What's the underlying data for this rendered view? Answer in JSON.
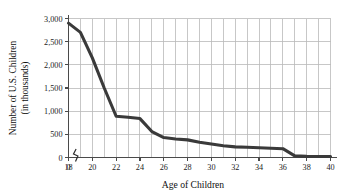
{
  "chart_data": {
    "type": "line",
    "title": "",
    "xlabel": "Age of Children",
    "ylabel_line1": "Number of U.S. Children",
    "ylabel_line2": "(in thousands)",
    "xlim": [
      18,
      40
    ],
    "ylim": [
      0,
      3000
    ],
    "grid": true,
    "legend": "none",
    "axis_break_x": true,
    "x_origin_label": "0",
    "x_tick_labels": [
      "18",
      "20",
      "22",
      "24",
      "26",
      "28",
      "30",
      "32",
      "34",
      "36",
      "38",
      "40"
    ],
    "x_tick_values": [
      18,
      20,
      22,
      24,
      26,
      28,
      30,
      32,
      34,
      36,
      38,
      40
    ],
    "x_gridline_values": [
      18,
      19,
      20,
      21,
      22,
      23,
      24,
      25,
      26,
      27,
      28,
      29,
      30,
      31,
      32,
      33,
      34,
      35,
      36,
      37,
      38,
      39,
      40
    ],
    "y_tick_labels": [
      "0",
      "500",
      "1,000",
      "1,500",
      "2,000",
      "2,500",
      "3,000"
    ],
    "y_tick_values": [
      0,
      500,
      1000,
      1500,
      2000,
      2500,
      3000
    ],
    "series": [
      {
        "name": "Number of U.S. Children",
        "color": "#3a3a3a",
        "x": [
          18,
          19,
          20,
          21,
          22,
          23,
          24,
          25,
          26,
          27,
          28,
          29,
          30,
          31,
          32,
          33,
          34,
          35,
          36,
          37,
          38,
          39,
          40
        ],
        "values": [
          2900,
          2700,
          2150,
          1500,
          890,
          870,
          840,
          560,
          430,
          400,
          380,
          330,
          290,
          255,
          230,
          220,
          210,
          200,
          190,
          35,
          25,
          22,
          20
        ]
      }
    ]
  },
  "figure": {
    "background_color": "#ffffff",
    "line_color": "#3a3a3a",
    "grid_color": "#b9b9b9",
    "axis_color": "#4a4a4a"
  }
}
